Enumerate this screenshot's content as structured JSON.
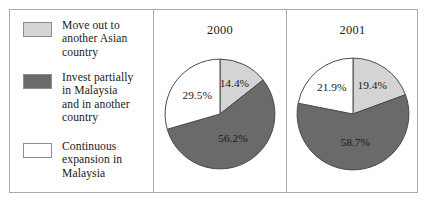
{
  "figure": {
    "caption": "",
    "colors": {
      "light_gray": "#d4d4d4",
      "dark_gray": "#6a6a6a",
      "white": "#ffffff",
      "outline": "#4a4a4a",
      "border": "#a9a9a9",
      "text": "#1a1a1a"
    }
  },
  "legend": {
    "items": [
      {
        "label": "Move out to\nanother Asian\ncountry",
        "color": "#d4d4d4",
        "swatch_name": "legend-swatch-move-out"
      },
      {
        "label": "Invest partially\nin Malaysia\nand in another\ncountry",
        "color": "#6a6a6a",
        "swatch_name": "legend-swatch-invest-partially"
      },
      {
        "label": "Continuous\nexpansion in\nMalaysia",
        "color": "#ffffff",
        "swatch_name": "legend-swatch-continuous-expansion"
      }
    ]
  },
  "chart_data": [
    {
      "type": "pie",
      "title": "2000",
      "categories": [
        "Move out to another Asian country",
        "Invest partially in Malaysia and in another country",
        "Continuous expansion in Malaysia"
      ],
      "values": [
        14.4,
        56.2,
        29.5
      ],
      "labels": [
        "14.4%",
        "56.2%",
        "29.5%"
      ],
      "colors": [
        "#d4d4d4",
        "#6a6a6a",
        "#ffffff"
      ],
      "units": "percent",
      "start_angle_deg": 0,
      "direction": "clockwise",
      "legend_position": "left",
      "grid": false
    },
    {
      "type": "pie",
      "title": "2001",
      "categories": [
        "Move out to another Asian country",
        "Invest partially in Malaysia and in another country",
        "Continuous expansion in Malaysia"
      ],
      "values": [
        19.4,
        58.7,
        21.9
      ],
      "labels": [
        "19.4%",
        "58.7%",
        "21.9%"
      ],
      "colors": [
        "#d4d4d4",
        "#6a6a6a",
        "#ffffff"
      ],
      "units": "percent",
      "start_angle_deg": 0,
      "direction": "clockwise",
      "legend_position": "left",
      "grid": false
    }
  ]
}
